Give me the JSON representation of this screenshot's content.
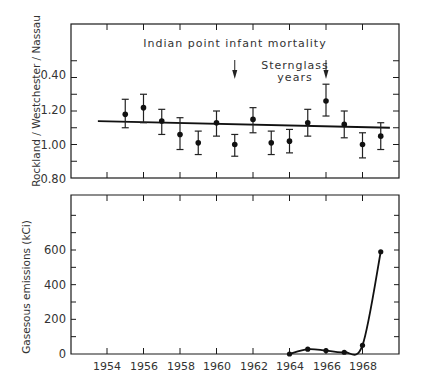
{
  "chart_data": [
    {
      "type": "scatter",
      "panel": "top",
      "title": "Indian point infant mortality",
      "annotation": "Sternglass years",
      "annotation_arrows_at": [
        1961,
        1966
      ],
      "xlabel": "",
      "ylabel": "Rockland / Westchester / Nassau",
      "ylim": [
        0.8,
        1.6
      ],
      "xlim": [
        1952,
        1970
      ],
      "yticks": [
        0.8,
        1.0,
        1.2,
        1.4
      ],
      "ytick_labels": [
        "0.80",
        "1.00",
        "1.20",
        "0.40"
      ],
      "grid": false,
      "x": [
        1955,
        1956,
        1957,
        1958,
        1959,
        1960,
        1961,
        1962,
        1963,
        1964,
        1965,
        1966,
        1967,
        1968,
        1969
      ],
      "values": [
        1.18,
        1.22,
        1.14,
        1.06,
        1.01,
        1.13,
        1.0,
        1.15,
        1.01,
        1.02,
        1.13,
        1.26,
        1.12,
        1.0,
        1.05
      ],
      "err_low": [
        1.1,
        1.13,
        1.06,
        0.97,
        0.94,
        1.05,
        0.93,
        1.07,
        0.94,
        0.95,
        1.05,
        1.17,
        1.04,
        0.92,
        0.97
      ],
      "err_high": [
        1.27,
        1.3,
        1.21,
        1.16,
        1.08,
        1.2,
        1.06,
        1.22,
        1.08,
        1.09,
        1.21,
        1.36,
        1.2,
        1.07,
        1.13
      ],
      "trend_line": {
        "x": [
          1953.5,
          1969.5
        ],
        "y": [
          1.14,
          1.1
        ]
      }
    },
    {
      "type": "line",
      "panel": "bottom",
      "title": "",
      "xlabel": "",
      "ylabel": "Gasesous emissions (kCi)",
      "ylim": [
        0,
        900
      ],
      "xlim": [
        1952,
        1970
      ],
      "yticks": [
        0,
        200,
        400,
        600
      ],
      "xticks": [
        1954,
        1956,
        1958,
        1960,
        1962,
        1964,
        1966,
        1968
      ],
      "grid": false,
      "x": [
        1964,
        1965,
        1966,
        1967,
        1968,
        1969
      ],
      "values": [
        0,
        28,
        20,
        10,
        50,
        590
      ]
    }
  ],
  "labels": {
    "top_title": "Indian point infant mortality",
    "annotation_line1": "Sternglass",
    "annotation_line2": "years",
    "top_ylabel": "Rockland / Westchester / Nassau",
    "bottom_ylabel": "Gasesous emissions (kCi)",
    "top_yticks": [
      "0.40",
      "1.20",
      "1.00",
      "0.80"
    ],
    "bottom_yticks": [
      "600",
      "400",
      "200",
      "0"
    ],
    "xticks": [
      "1954",
      "1956",
      "1958",
      "1960",
      "1962",
      "1964",
      "1966",
      "1968"
    ]
  }
}
